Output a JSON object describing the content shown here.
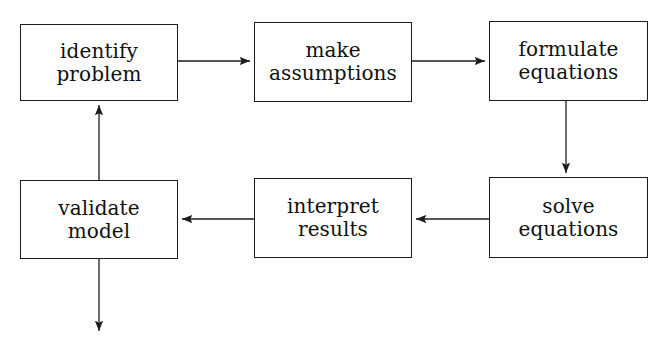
{
  "diagram": {
    "background_color": "#ffffff",
    "stroke_color": "#1c1c1c",
    "text_color": "#111111",
    "width": 671,
    "height": 351,
    "nodes": [
      {
        "id": "identify-problem",
        "line1": "identify",
        "line2": "problem",
        "x": 20,
        "y": 24,
        "w": 158,
        "h": 77
      },
      {
        "id": "make-assumptions",
        "line1": "make",
        "line2": "assumptions",
        "x": 254,
        "y": 22,
        "w": 158,
        "h": 80
      },
      {
        "id": "formulate-equations",
        "line1": "formulate",
        "line2": "equations",
        "x": 489,
        "y": 21,
        "w": 159,
        "h": 80
      },
      {
        "id": "validate-model",
        "line1": "validate",
        "line2": "model",
        "x": 20,
        "y": 180,
        "w": 158,
        "h": 79
      },
      {
        "id": "interpret-results",
        "line1": "interpret",
        "line2": "results",
        "x": 254,
        "y": 178,
        "w": 158,
        "h": 80
      },
      {
        "id": "solve-equations",
        "line1": "solve",
        "line2": "equations",
        "x": 489,
        "y": 177,
        "w": 159,
        "h": 81
      }
    ],
    "edges": [
      {
        "id": "identify-problem-to-make-assumptions",
        "from": "identify-problem",
        "to": "make-assumptions",
        "direction": "right",
        "path": "M 178 61 L 252 61"
      },
      {
        "id": "make-assumptions-to-formulate-equations",
        "from": "make-assumptions",
        "to": "formulate-equations",
        "direction": "right",
        "path": "M 412 61 L 487 61"
      },
      {
        "id": "formulate-equations-to-solve-equations",
        "from": "formulate-equations",
        "to": "solve-equations",
        "direction": "down",
        "path": "M 566 101 L 566 175"
      },
      {
        "id": "solve-equations-to-interpret-results",
        "from": "solve-equations",
        "to": "interpret-results",
        "direction": "left",
        "path": "M 489 219 L 414 219"
      },
      {
        "id": "interpret-results-to-validate-model",
        "from": "interpret-results",
        "to": "validate-model",
        "direction": "left",
        "path": "M 254 219 L 180 219"
      },
      {
        "id": "validate-model-to-identify-problem",
        "from": "validate-model",
        "to": "identify-problem",
        "direction": "up",
        "path": "M 99 180 L 99 103"
      },
      {
        "id": "validate-model-output",
        "from": "validate-model",
        "to": null,
        "direction": "down",
        "path": "M 99 259 L 99 333"
      }
    ]
  }
}
